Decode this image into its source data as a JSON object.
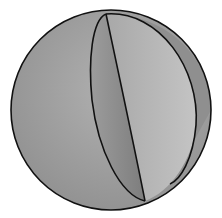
{
  "diagram": {
    "type": "sphere-with-lunes",
    "sphere": {
      "cx": 111,
      "cy": 110,
      "r": 100
    },
    "colors": {
      "background": "#ffffff",
      "outline": "#111111",
      "sphere_fill": "#9a9a9a",
      "lune_dark": "#8a8a8a",
      "lune_light": "#b5b5b5",
      "right_band": "#8f8f8f"
    },
    "vertices": {
      "top": [
        106,
        14
      ],
      "bottom": [
        145,
        201
      ]
    }
  }
}
